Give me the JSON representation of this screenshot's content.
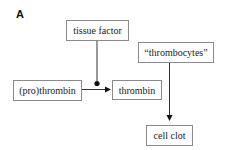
{
  "panel": {
    "label": "A"
  },
  "nodes": {
    "tissue_factor": {
      "label": "tissue factor"
    },
    "prothrombin": {
      "label": "(pro)thrombin"
    },
    "thrombin": {
      "label": "thrombin"
    },
    "thrombocytes": {
      "label": "“thrombocytes”"
    },
    "cell_clot": {
      "label": "cell clot"
    }
  },
  "edges": [
    {
      "from": "prothrombin",
      "to": "thrombin",
      "type": "arrow"
    },
    {
      "from": "tissue_factor",
      "to": "prothrombin->thrombin",
      "type": "catalysis-dot"
    },
    {
      "from": "thrombocytes",
      "to": "cell_clot",
      "type": "arrow"
    }
  ],
  "colors": {
    "stroke": "#111111",
    "box_border": "#8a8a8a",
    "text": "#222222"
  }
}
